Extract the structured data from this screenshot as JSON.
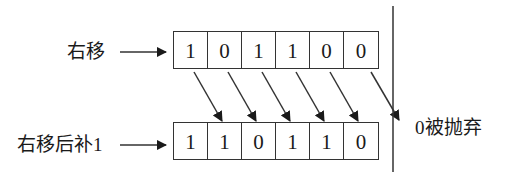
{
  "diagram": {
    "top_row": {
      "label": "右移",
      "bits": [
        "1",
        "0",
        "1",
        "1",
        "0",
        "0"
      ]
    },
    "bottom_row": {
      "label": "右移后补1",
      "bits": [
        "1",
        "1",
        "0",
        "1",
        "1",
        "0"
      ]
    },
    "discard_note": "0被抛弃",
    "colors": {
      "line": "#333333",
      "text": "#1a1a1a",
      "background": "#ffffff"
    }
  }
}
